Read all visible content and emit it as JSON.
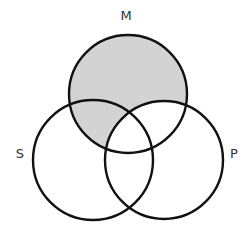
{
  "diagram": {
    "type": "venn-3",
    "sets": [
      {
        "id": "M",
        "label": "M",
        "cx": 128,
        "cy": 94,
        "r": 59
      },
      {
        "id": "S",
        "label": "S",
        "cx": 93,
        "cy": 160,
        "r": 60
      },
      {
        "id": "P",
        "label": "P",
        "cx": 164,
        "cy": 160,
        "r": 59
      }
    ],
    "shaded_regions": [
      "M only",
      "M and S but not P"
    ],
    "shade_color": "#d3d3d3",
    "stroke_color": "#111111"
  },
  "labels": {
    "M": "M",
    "S": "S",
    "P": "P"
  }
}
